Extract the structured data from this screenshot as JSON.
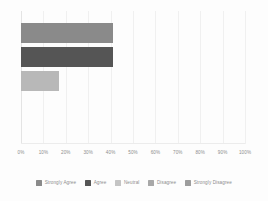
{
  "chart_data": {
    "type": "bar",
    "orientation": "horizontal",
    "title": "",
    "subtitle": "",
    "xlabel": "",
    "ylabel": "",
    "xlim": [
      0,
      100
    ],
    "xtick_labels": [
      "0%",
      "10%",
      "20%",
      "30%",
      "40%",
      "50%",
      "60%",
      "70%",
      "80%",
      "90%",
      "100%"
    ],
    "xtick_values": [
      0,
      10,
      20,
      30,
      40,
      50,
      60,
      70,
      80,
      90,
      100
    ],
    "grid": true,
    "grid_axis": "x",
    "legend_position": "bottom",
    "categories": [
      "Strongly Agree",
      "Agree",
      "Neutral",
      "Disagree",
      "Strongly Disagree"
    ],
    "values": [
      41,
      41,
      17,
      0,
      0
    ],
    "colors": [
      "#8a8a8a",
      "#555555",
      "#b8b8b8",
      "#9a9a9a",
      "#8a8a8a"
    ],
    "bars": [
      {
        "label": "Strongly Agree",
        "value": 41,
        "color": "#8a8a8a"
      },
      {
        "label": "Agree",
        "value": 41,
        "color": "#555555"
      },
      {
        "label": "Neutral",
        "value": 17,
        "color": "#b8b8b8"
      },
      {
        "label": "Disagree",
        "value": 0,
        "color": "#9a9a9a"
      },
      {
        "label": "Strongly Disagree",
        "value": 0,
        "color": "#8a8a8a"
      }
    ]
  },
  "legend": {
    "items": [
      {
        "label": "Strongly Agree",
        "color": "#8a8a8a"
      },
      {
        "label": "Agree",
        "color": "#555555"
      },
      {
        "label": "Neutral",
        "color": "#c4c4c4"
      },
      {
        "label": "Disagree",
        "color": "#a8a8a8"
      },
      {
        "label": "Strongly Disagree",
        "color": "#9d9d9d"
      }
    ]
  },
  "style": {
    "background": "#fdfdfd",
    "gridline_color": "#f0f0f0",
    "tick_text_color": "#8d8d8d"
  }
}
